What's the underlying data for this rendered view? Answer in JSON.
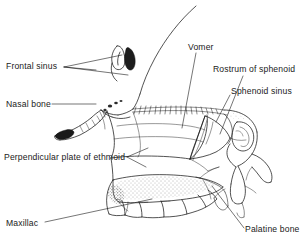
{
  "figure": {
    "background_color": "#ffffff",
    "line_color": "#1a1a1a",
    "width": 305,
    "height": 244
  },
  "labels": {
    "frontal_sinus": "Frontal sinus",
    "nasal_bone": "Nasal bone",
    "perpendicular_plate_of_ethmoid": "Perpendicular plate of ethmoid",
    "maxillac": "Maxillac",
    "vomer": "Vomer",
    "rostrum_of_sphenoid": "Rostrum of sphenoid",
    "sphenoid_sinus": "Sphenoid sinus",
    "palatine_bone": "Palatine bone"
  },
  "label_list": [
    {
      "key": "frontal_sinus",
      "text": "Frontal sinus",
      "side": "left",
      "leader": "forked"
    },
    {
      "key": "nasal_bone",
      "text": "Nasal bone",
      "side": "left",
      "leader": "single"
    },
    {
      "key": "perpendicular_plate_of_ethmoid",
      "text": "Perpendicular plate of ethmoid",
      "side": "left",
      "leader": "forked"
    },
    {
      "key": "maxillac",
      "text": "Maxillac",
      "side": "left",
      "leader": "single"
    },
    {
      "key": "vomer",
      "text": "Vomer",
      "side": "right",
      "leader": "single"
    },
    {
      "key": "rostrum_of_sphenoid",
      "text": "Rostrum of sphenoid",
      "side": "right",
      "leader": "single"
    },
    {
      "key": "sphenoid_sinus",
      "text": "Sphenoid sinus",
      "side": "right",
      "leader": "single"
    },
    {
      "key": "palatine_bone",
      "text": "Palatine bone",
      "side": "right",
      "leader": "single"
    }
  ]
}
